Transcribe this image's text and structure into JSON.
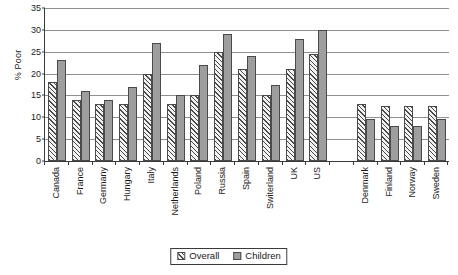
{
  "chart_data": {
    "type": "bar",
    "title": "",
    "subtitle": "",
    "xlabel": "",
    "ylabel": "% Poor",
    "ylim": [
      0,
      35
    ],
    "ytick_step": 5,
    "yticks": [
      0,
      5,
      10,
      15,
      20,
      25,
      30,
      35
    ],
    "ytick_labels": [
      "0",
      "5",
      "10",
      "15",
      "20",
      "25",
      "30",
      "35"
    ],
    "grid": true,
    "grid_axis": "y",
    "legend_position": "bottom-center",
    "categories": [
      "Canada",
      "France",
      "Germany",
      "Hungary",
      "Italy",
      "Netherlands",
      "Poland",
      "Russia",
      "Spain",
      "Switerland",
      "UK",
      "US",
      "",
      "Denmark",
      "Finland",
      "Norway",
      "Sweden"
    ],
    "series": [
      {
        "name": "Overall",
        "pattern": "diagonal-hatch",
        "color": "#f2f2f2",
        "values": [
          18,
          14,
          13,
          13,
          20,
          13,
          15,
          25,
          21,
          15,
          21,
          24.5,
          null,
          13,
          12.5,
          12.5,
          12.5
        ]
      },
      {
        "name": "Children",
        "pattern": "solid",
        "color": "#9e9e9e",
        "values": [
          23,
          16,
          14,
          17,
          27,
          15,
          22,
          29,
          24,
          17.5,
          28,
          30,
          null,
          9.5,
          8,
          8,
          9.5
        ]
      }
    ],
    "annotations": []
  },
  "legend": {
    "entries": [
      {
        "label": "Overall"
      },
      {
        "label": "Children"
      }
    ]
  }
}
